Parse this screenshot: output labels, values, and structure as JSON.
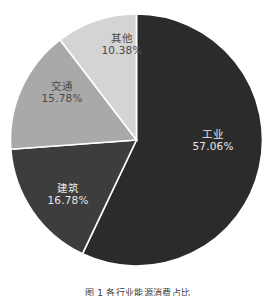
{
  "chart_data": {
    "type": "pie",
    "title": "",
    "categories": [
      "工业",
      "建筑",
      "交通",
      "其他"
    ],
    "values": [
      57.06,
      16.78,
      15.78,
      10.38
    ],
    "value_labels": [
      "57.06%",
      "16.78%",
      "15.78%",
      "10.38%"
    ],
    "colors": [
      "#2b2b2b",
      "#3d3d3d",
      "#a9a9a9",
      "#d4d4d4"
    ],
    "slice_border_color": "#ffffff",
    "start_angle_deg": 0,
    "direction": "clockwise",
    "labels_position": "inside",
    "legend": "none",
    "grid": false,
    "background": "#ffffff"
  },
  "slices": {
    "industry": {
      "name": "工业",
      "value": "57.06%"
    },
    "construction": {
      "name": "建筑",
      "value": "16.78%"
    },
    "transport": {
      "name": "交通",
      "value": "15.78%"
    },
    "other": {
      "name": "其他",
      "value": "10.38%"
    }
  },
  "caption": {
    "text": "图 1  各行业能源消费占比"
  }
}
